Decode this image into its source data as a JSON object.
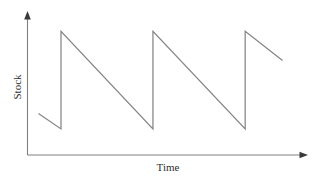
{
  "chart_data": {
    "type": "line",
    "title": "",
    "subtitle": "",
    "xlabel": "Time",
    "ylabel": "Stock",
    "grid": false,
    "legend": false,
    "legend_position": "none",
    "axis_style": "arrow-tipped open axes, no tick marks, no tick labels",
    "xlim": [
      0,
      100
    ],
    "ylim": [
      0,
      100
    ],
    "x_tick_labels": [],
    "y_tick_labels": [],
    "annotations": [],
    "line_color": "#858585",
    "axis_color": "#808080",
    "background_color": "#ffffff",
    "series": [
      {
        "name": "Stock level",
        "points": [
          {
            "x": 4.0,
            "y": 30.0
          },
          {
            "x": 12.2,
            "y": 18.9
          },
          {
            "x": 12.2,
            "y": 89.6
          },
          {
            "x": 45.7,
            "y": 18.9
          },
          {
            "x": 45.7,
            "y": 89.6
          },
          {
            "x": 79.3,
            "y": 18.9
          },
          {
            "x": 79.3,
            "y": 89.6
          },
          {
            "x": 92.9,
            "y": 68.5
          }
        ]
      }
    ],
    "cycles": [
      {
        "index": 1,
        "peak_x": 12.2,
        "trough_x": 45.7,
        "peak_y": 89.6,
        "trough_y": 18.9
      },
      {
        "index": 2,
        "peak_x": 45.7,
        "trough_x": 79.3,
        "peak_y": 89.6,
        "trough_y": 18.9
      },
      {
        "index": 3,
        "peak_x": 79.3,
        "trough_x": 92.9,
        "peak_y": 89.6,
        "trough_y": 68.5
      }
    ]
  },
  "labels": {
    "y_axis_label": "Stock",
    "x_axis_label": "Time"
  }
}
